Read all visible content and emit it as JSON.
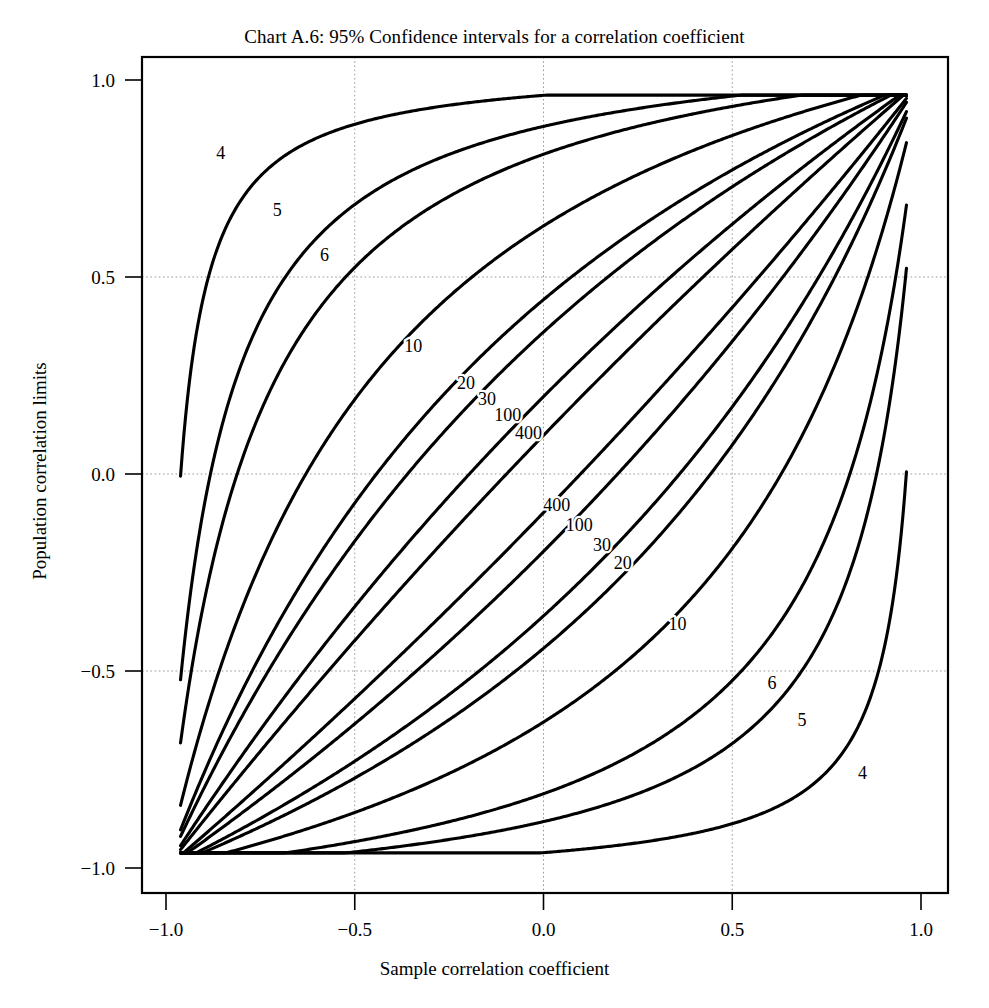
{
  "chart_data": {
    "type": "line",
    "title": "Chart A.6: 95% Confidence intervals for a correlation coefficient",
    "xlabel": "Sample correlation coefficient",
    "ylabel": "Population correlation limits",
    "xlim": [
      -1.0,
      1.0
    ],
    "ylim": [
      -1.0,
      1.0
    ],
    "xticks": [
      "-1.0",
      "-0.5",
      "0.0",
      "0.5",
      "1.0"
    ],
    "xtick_values": [
      -1.0,
      -0.5,
      0.0,
      0.5,
      1.0
    ],
    "yticks": [
      "1.0",
      "0.5",
      "0.0",
      "-0.5",
      "-1.0"
    ],
    "ytick_values": [
      1.0,
      0.5,
      0.0,
      -0.5,
      -1.0
    ],
    "grid": true,
    "grid_style": "dotted",
    "legend": "none",
    "line_color": "#000000",
    "background": "#ffffff",
    "confidence_level": 0.95,
    "z_critical": 1.959964,
    "sample_sizes": [
      4,
      5,
      6,
      10,
      20,
      30,
      100,
      400
    ],
    "curve_model": "Fisher z-transform: rho = tanh(atanh(r) -/+ 1.96/sqrt(n-3))",
    "series": [
      {
        "name": "n=4 upper",
        "n": 4,
        "bound": "upper"
      },
      {
        "name": "n=5 upper",
        "n": 5,
        "bound": "upper"
      },
      {
        "name": "n=6 upper",
        "n": 6,
        "bound": "upper"
      },
      {
        "name": "n=10 upper",
        "n": 10,
        "bound": "upper"
      },
      {
        "name": "n=20 upper",
        "n": 20,
        "bound": "upper"
      },
      {
        "name": "n=30 upper",
        "n": 30,
        "bound": "upper"
      },
      {
        "name": "n=100 upper",
        "n": 100,
        "bound": "upper"
      },
      {
        "name": "n=400 upper",
        "n": 400,
        "bound": "upper"
      },
      {
        "name": "n=400 lower",
        "n": 400,
        "bound": "lower"
      },
      {
        "name": "n=100 lower",
        "n": 100,
        "bound": "lower"
      },
      {
        "name": "n=30 lower",
        "n": 30,
        "bound": "lower"
      },
      {
        "name": "n=20 lower",
        "n": 20,
        "bound": "lower"
      },
      {
        "name": "n=10 lower",
        "n": 10,
        "bound": "lower"
      },
      {
        "name": "n=6 lower",
        "n": 6,
        "bound": "lower"
      },
      {
        "name": "n=5 lower",
        "n": 5,
        "bound": "lower"
      },
      {
        "name": "n=4 lower",
        "n": 4,
        "bound": "lower"
      }
    ],
    "annotations": [
      {
        "text": "4",
        "x": -0.855,
        "y": 0.8,
        "group": "upper"
      },
      {
        "text": "5",
        "x": -0.705,
        "y": 0.655,
        "group": "upper"
      },
      {
        "text": "6",
        "x": -0.58,
        "y": 0.54,
        "group": "upper"
      },
      {
        "text": "10",
        "x": -0.345,
        "y": 0.31,
        "group": "upper"
      },
      {
        "text": "20",
        "x": -0.205,
        "y": 0.215,
        "group": "upper"
      },
      {
        "text": "30",
        "x": -0.15,
        "y": 0.175,
        "group": "upper"
      },
      {
        "text": "100",
        "x": -0.095,
        "y": 0.135,
        "group": "upper"
      },
      {
        "text": "400",
        "x": -0.04,
        "y": 0.09,
        "group": "upper"
      },
      {
        "text": "400",
        "x": 0.035,
        "y": -0.095,
        "group": "lower"
      },
      {
        "text": "100",
        "x": 0.095,
        "y": -0.145,
        "group": "lower"
      },
      {
        "text": "30",
        "x": 0.155,
        "y": -0.195,
        "group": "lower"
      },
      {
        "text": "20",
        "x": 0.21,
        "y": -0.24,
        "group": "lower"
      },
      {
        "text": "10",
        "x": 0.355,
        "y": -0.395,
        "group": "lower"
      },
      {
        "text": "6",
        "x": 0.605,
        "y": -0.545,
        "group": "lower"
      },
      {
        "text": "5",
        "x": 0.685,
        "y": -0.64,
        "group": "lower"
      },
      {
        "text": "4",
        "x": 0.845,
        "y": -0.775,
        "group": "lower"
      }
    ]
  }
}
